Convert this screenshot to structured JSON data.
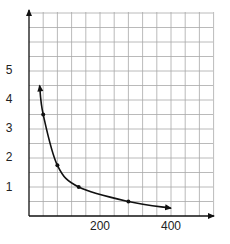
{
  "chart_data": {
    "type": "line",
    "title": "",
    "xlabel": "",
    "ylabel": "",
    "xlim": [
      0,
      520
    ],
    "ylim": [
      0,
      7
    ],
    "grid": true,
    "grid_x_step": 40,
    "grid_y_step": 0.5,
    "x_ticks": [
      200,
      400
    ],
    "x_tick_labels": [
      "200",
      "400"
    ],
    "y_ticks": [
      1,
      2,
      3,
      4,
      5
    ],
    "y_tick_labels": [
      "1",
      "2",
      "3",
      "4",
      "5"
    ],
    "series": [
      {
        "name": "curve",
        "style": "smooth line with arrowheads at both ends",
        "curve_x": [
          30,
          40,
          80,
          140,
          280,
          400
        ],
        "curve_y": [
          4.5,
          3.5,
          1.75,
          1.0,
          0.5,
          0.27
        ],
        "marked_points": [
          {
            "x": 40,
            "y": 3.5
          },
          {
            "x": 80,
            "y": 1.75
          },
          {
            "x": 140,
            "y": 1.0
          },
          {
            "x": 280,
            "y": 0.5
          }
        ]
      }
    ],
    "legend": null
  },
  "axes": {
    "y_labels": [
      "5",
      "4",
      "3",
      "2",
      "1"
    ],
    "x_labels": [
      "200",
      "400"
    ]
  },
  "colors": {
    "grid": "#a8a8a8",
    "axis": "#111111",
    "curve": "#111111"
  }
}
